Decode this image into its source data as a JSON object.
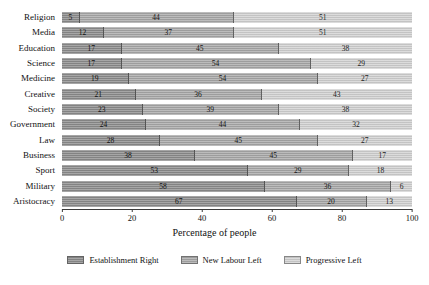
{
  "chart_data": {
    "type": "bar",
    "orientation": "horizontal",
    "stacked": true,
    "title": "",
    "xlabel": "Percentage of people",
    "ylabel": "",
    "xlim": [
      0,
      100
    ],
    "xticks": [
      0,
      20,
      40,
      60,
      80,
      100
    ],
    "grid": false,
    "legend_position": "bottom",
    "categories": [
      "Religion",
      "Media",
      "Education",
      "Science",
      "Medicine",
      "Creative",
      "Society",
      "Government",
      "Law",
      "Business",
      "Sport",
      "Military",
      "Aristocracy"
    ],
    "series": [
      {
        "name": "Establishment Right",
        "color": "#8d8d8d",
        "values": [
          5,
          12,
          17,
          17,
          19,
          21,
          23,
          24,
          28,
          38,
          53,
          58,
          67
        ]
      },
      {
        "name": "New Labour Left",
        "color": "#a9a9a9",
        "values": [
          44,
          37,
          45,
          54,
          54,
          36,
          39,
          44,
          45,
          45,
          29,
          36,
          20
        ]
      },
      {
        "name": "Progressive Left",
        "color": "#d2d2d2",
        "values": [
          51,
          51,
          38,
          29,
          27,
          43,
          38,
          32,
          27,
          17,
          18,
          6,
          13
        ]
      }
    ]
  }
}
